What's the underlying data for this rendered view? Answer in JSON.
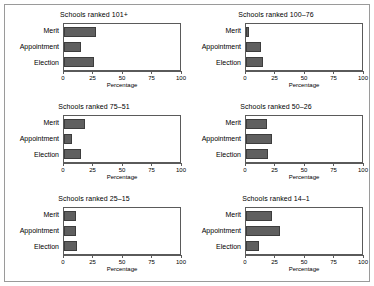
{
  "figure": {
    "categories": [
      "Merit",
      "Appointment",
      "Election"
    ],
    "axis_title": "Percentage",
    "tick_labels": [
      "0",
      "25",
      "50",
      "75",
      "100"
    ],
    "tick_values": [
      0,
      25,
      50,
      75,
      100
    ],
    "bar_color": "#5f5f5f",
    "frame_color": "#5a5a5a",
    "background": "#ffffff"
  },
  "panels": [
    {
      "title": "Schools ranked 101+",
      "values": [
        28,
        15,
        26
      ]
    },
    {
      "title": "Schools ranked 100–76",
      "values": [
        3,
        13,
        15
      ]
    },
    {
      "title": "Schools ranked 75–51",
      "values": [
        18,
        7,
        15
      ]
    },
    {
      "title": "Schools ranked 50–26",
      "values": [
        18,
        22,
        19
      ]
    },
    {
      "title": "Schools ranked 25–15",
      "values": [
        10,
        10,
        11
      ]
    },
    {
      "title": "Schools ranked 14–1",
      "values": [
        22,
        29,
        11
      ]
    }
  ],
  "chart_data": {
    "type": "bar",
    "title": "",
    "xlabel": "Percentage",
    "ylabel": "",
    "xlim": [
      0,
      100
    ],
    "orientation": "horizontal",
    "grid": false,
    "legend": "none",
    "categories": [
      "Merit",
      "Appointment",
      "Election"
    ],
    "panels": [
      {
        "name": "Schools ranked 101+",
        "categories": [
          "Merit",
          "Appointment",
          "Election"
        ],
        "values": [
          28,
          15,
          26
        ]
      },
      {
        "name": "Schools ranked 100–76",
        "categories": [
          "Merit",
          "Appointment",
          "Election"
        ],
        "values": [
          3,
          13,
          15
        ]
      },
      {
        "name": "Schools ranked 75–51",
        "categories": [
          "Merit",
          "Appointment",
          "Election"
        ],
        "values": [
          18,
          7,
          15
        ]
      },
      {
        "name": "Schools ranked 50–26",
        "categories": [
          "Merit",
          "Appointment",
          "Election"
        ],
        "values": [
          18,
          22,
          19
        ]
      },
      {
        "name": "Schools ranked 25–15",
        "categories": [
          "Merit",
          "Appointment",
          "Election"
        ],
        "values": [
          10,
          10,
          11
        ]
      },
      {
        "name": "Schools ranked 14–1",
        "categories": [
          "Merit",
          "Appointment",
          "Election"
        ],
        "values": [
          22,
          29,
          11
        ]
      }
    ],
    "xticks": [
      0,
      25,
      50,
      75,
      100
    ],
    "xticklabels": [
      "0",
      "25",
      "50",
      "75",
      "100"
    ]
  }
}
